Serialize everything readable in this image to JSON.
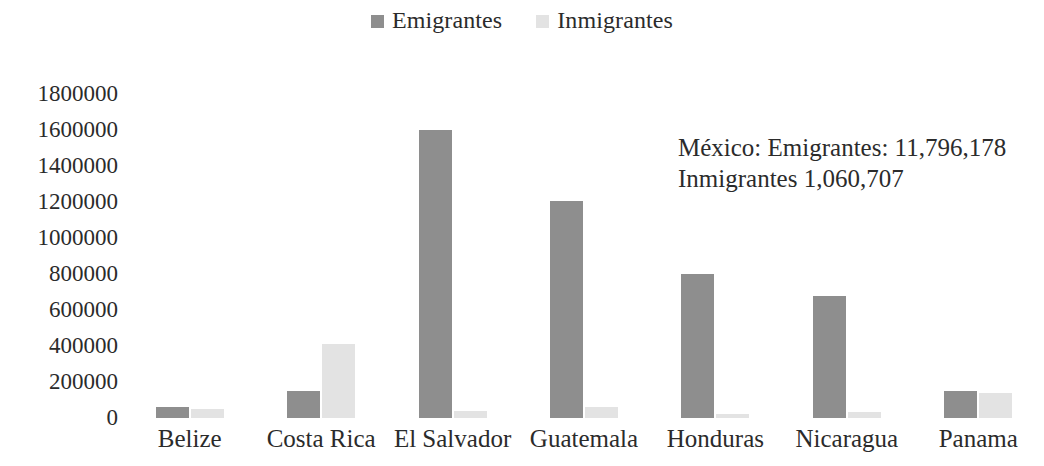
{
  "chart_data": {
    "type": "bar",
    "title": "",
    "subtitle": "",
    "xlabel": "",
    "ylabel": "",
    "grid": false,
    "legend_position": "top-center",
    "ylim": [
      0,
      1800000
    ],
    "ytick_step": 200000,
    "ytick_labels": [
      "1800000",
      "1600000",
      "1400000",
      "1200000",
      "1000000",
      "800000",
      "600000",
      "400000",
      "200000",
      "0"
    ],
    "ytick_values": [
      1800000,
      1600000,
      1400000,
      1200000,
      1000000,
      800000,
      600000,
      400000,
      200000,
      0
    ],
    "categories": [
      "Belize",
      "Costa Rica",
      "El Salvador",
      "Guatemala",
      "Honduras",
      "Nicaragua",
      "Panama"
    ],
    "series": [
      {
        "name": "Emigrantes",
        "color": "#8e8e8e",
        "values": [
          60000,
          150000,
          1600000,
          1205000,
          800000,
          680000,
          150000
        ]
      },
      {
        "name": "Inmigrantes",
        "color": "#e3e3e3",
        "values": [
          50000,
          410000,
          40000,
          60000,
          25000,
          35000,
          140000
        ]
      }
    ],
    "annotations": [
      "México: Emigrantes: 11,796,178",
      "Inmigrantes 1,060,707"
    ]
  },
  "legend": {
    "items": [
      {
        "label": "Emigrantes",
        "swatch_name": "legend-swatch-emigrantes"
      },
      {
        "label": "Inmigrantes",
        "swatch_name": "legend-swatch-inmigrantes"
      }
    ]
  }
}
